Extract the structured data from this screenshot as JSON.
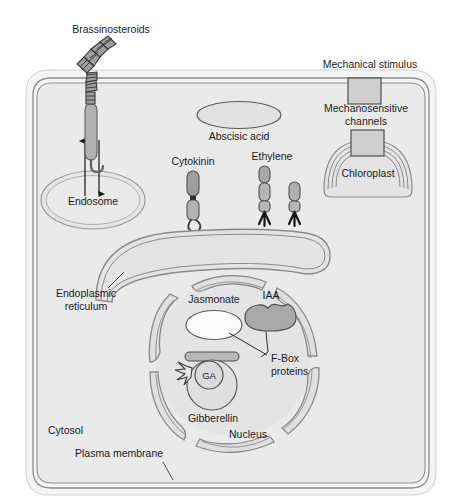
{
  "figure": {
    "kind": "cell-signaling-diagram"
  },
  "palette": {
    "cell_wall": "#f2f2f2",
    "cytosol": "#e9e9e9",
    "membrane_line": "#8a8a8a",
    "organelle_fill": "#e0e0e0",
    "organelle_line": "#6f6f6f",
    "receptor_fill": "#b5b5b5",
    "receptor_dark": "#8c8c8c",
    "fbox_fill": "#a8a8a8",
    "jasmonate_fill": "#fcfcfc",
    "text": "#1a1a1a",
    "arrow": "#111111"
  },
  "labels": {
    "brassinosteroids": "Brassinosteroids",
    "endosome": "Endosome",
    "cytokinin": "Cytokinin",
    "abscisic_acid": "Abscisic acid",
    "ethylene": "Ethylene",
    "mechanical_stimulus": "Mechanical stimulus",
    "mechanosensitive_channels_line1": "Mechanosensitive",
    "mechanosensitive_channels_line2": "channels",
    "chloroplast": "Chloroplast",
    "endoplasmic_line1": "Endoplasmic",
    "endoplasmic_line2": "reticulum",
    "jasmonate": "Jasmonate",
    "iaa": "IAA",
    "fbox_line1": "F-Box",
    "fbox_line2": "proteins",
    "ga": "GA",
    "gibberellin": "Gibberellin",
    "nucleus": "Nucleus",
    "cytosol": "Cytosol",
    "plasma_membrane": "Plasma membrane"
  }
}
